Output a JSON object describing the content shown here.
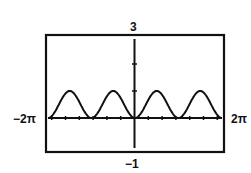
{
  "chart_data": {
    "type": "line",
    "title": "",
    "function": "y = sin^2(x)",
    "xlabel": "",
    "ylabel": "",
    "xlim": [
      -6.2832,
      6.2832
    ],
    "ylim": [
      -1,
      3
    ],
    "x_tick_labels": {
      "min": "-2π",
      "max": "2π"
    },
    "y_tick_labels": {
      "min": "-1",
      "max": "3"
    },
    "grid": false,
    "legend": null,
    "series": [
      {
        "name": "f(x)",
        "x": [
          -6.2832,
          -5.4978,
          -4.7124,
          -3.927,
          -3.1416,
          -2.3562,
          -1.5708,
          -0.7854,
          0,
          0.7854,
          1.5708,
          2.3562,
          3.1416,
          3.927,
          4.7124,
          5.4978,
          6.2832
        ],
        "values": [
          0,
          0.5,
          1,
          0.5,
          0,
          0.5,
          1,
          0.5,
          0,
          0.5,
          1,
          0.5,
          0,
          0.5,
          1,
          0.5,
          0
        ]
      }
    ]
  },
  "labels": {
    "ymax": "3",
    "ymin": "−1",
    "xmin": "−2π",
    "xmax": "2π"
  }
}
